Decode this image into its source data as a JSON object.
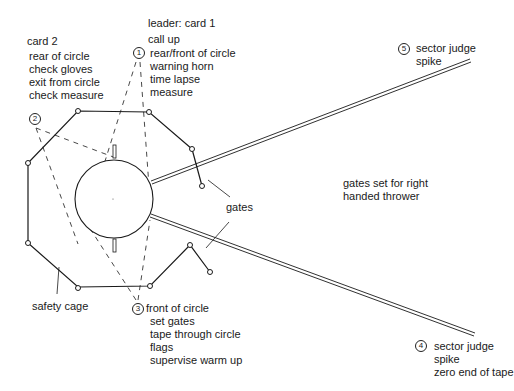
{
  "diagram": {
    "officials": [
      {
        "number": "1",
        "heading": "leader: card 1",
        "subheading": "call up",
        "duties": [
          "rear/front of circle",
          "warning horn",
          "time lapse",
          "measure"
        ]
      },
      {
        "number": "2",
        "heading": "card 2",
        "duties": [
          "rear of circle",
          "check gloves",
          "exit from circle",
          "check measure"
        ]
      },
      {
        "number": "3",
        "heading": "front of circle",
        "duties": [
          "set gates",
          "tape through circle",
          "flags",
          "supervise warm up"
        ]
      },
      {
        "number": "4",
        "heading": "sector judge",
        "duties": [
          "spike",
          "zero end of tape"
        ]
      },
      {
        "number": "5",
        "heading": "sector judge",
        "duties": [
          "spike"
        ]
      }
    ],
    "labels": {
      "gates": "gates",
      "gates_note_line1": "gates set for right",
      "gates_note_line2": "handed thrower",
      "safety_cage": "safety cage"
    },
    "colors": {
      "line": "#1a1a1a",
      "background": "#ffffff"
    }
  }
}
